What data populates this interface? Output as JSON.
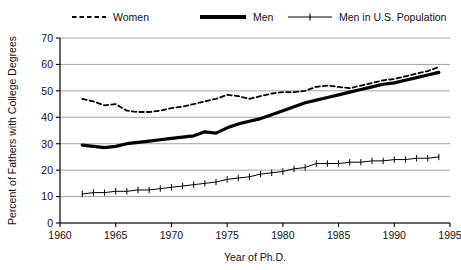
{
  "chart_data": {
    "type": "line",
    "title": "",
    "xlabel": "Year of Ph.D.",
    "ylabel": "Percent of Fathers with College Degrees",
    "xlim": [
      1960,
      1995
    ],
    "ylim": [
      0,
      70
    ],
    "xticks": [
      1960,
      1965,
      1970,
      1975,
      1980,
      1985,
      1990,
      1995
    ],
    "yticks": [
      0,
      10,
      20,
      30,
      40,
      50,
      60,
      70
    ],
    "grid": "horizontal",
    "legend_position": "top",
    "x": [
      1962,
      1963,
      1964,
      1965,
      1966,
      1967,
      1968,
      1969,
      1970,
      1971,
      1972,
      1973,
      1974,
      1975,
      1976,
      1977,
      1978,
      1979,
      1980,
      1981,
      1982,
      1983,
      1984,
      1985,
      1986,
      1987,
      1988,
      1989,
      1990,
      1991,
      1992,
      1993,
      1994
    ],
    "series": [
      {
        "name": "Women",
        "style": "dashed",
        "marker": "none",
        "color": "#000000",
        "width": 1.8,
        "values": [
          47.0,
          46.0,
          44.5,
          45.0,
          42.5,
          42.0,
          42.0,
          42.5,
          43.5,
          44.0,
          45.0,
          46.0,
          47.0,
          48.5,
          48.0,
          47.0,
          48.0,
          49.0,
          49.5,
          49.5,
          50.0,
          51.5,
          52.0,
          51.5,
          51.0,
          52.0,
          53.0,
          54.0,
          54.5,
          55.5,
          56.5,
          57.5,
          59.0
        ]
      },
      {
        "name": "Men",
        "style": "solid",
        "marker": "none",
        "color": "#000000",
        "width": 3.2,
        "values": [
          29.5,
          29.0,
          28.5,
          29.0,
          30.0,
          30.5,
          31.0,
          31.5,
          32.0,
          32.5,
          33.0,
          34.5,
          34.0,
          36.0,
          37.5,
          38.5,
          39.5,
          41.0,
          42.5,
          44.0,
          45.5,
          46.5,
          47.5,
          48.5,
          49.5,
          50.5,
          51.5,
          52.5,
          53.0,
          54.0,
          55.0,
          56.0,
          57.0
        ]
      },
      {
        "name": "Men in U.S. Population",
        "style": "solid",
        "marker": "plus",
        "color": "#000000",
        "width": 1.0,
        "values": [
          11.0,
          11.5,
          11.5,
          12.0,
          12.0,
          12.5,
          12.5,
          13.0,
          13.5,
          14.0,
          14.5,
          15.0,
          15.5,
          16.5,
          17.0,
          17.5,
          18.5,
          19.0,
          19.5,
          20.5,
          21.0,
          22.5,
          22.5,
          22.5,
          23.0,
          23.0,
          23.5,
          23.5,
          24.0,
          24.0,
          24.5,
          24.5,
          25.0
        ]
      }
    ]
  },
  "legend": {
    "items": [
      {
        "label": "Women"
      },
      {
        "label": "Men"
      },
      {
        "label": "Men in U.S. Population"
      }
    ]
  }
}
